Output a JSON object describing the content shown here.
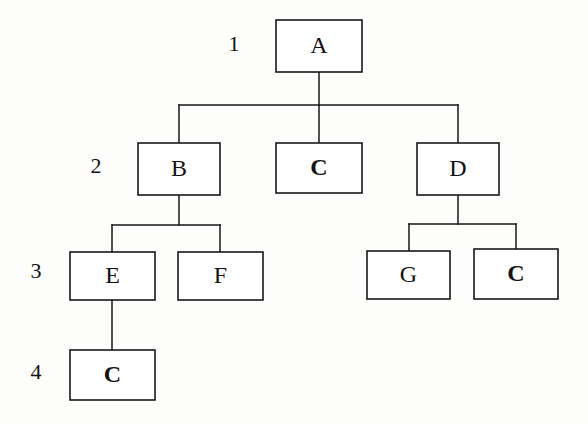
{
  "diagram": {
    "type": "tree",
    "background_color": "#fdfdfb",
    "line_color": "#16181a",
    "box_fill": "#ffffff",
    "text_color": "#121212",
    "canvas": {
      "width": 588,
      "height": 424
    },
    "level_labels": [
      {
        "id": "level-1",
        "text": "1",
        "x": 234,
        "y": 46,
        "font_size": 22
      },
      {
        "id": "level-2",
        "text": "2",
        "x": 96,
        "y": 168,
        "font_size": 22
      },
      {
        "id": "level-3",
        "text": "3",
        "x": 36,
        "y": 273,
        "font_size": 22
      },
      {
        "id": "level-4",
        "text": "4",
        "x": 36,
        "y": 374,
        "font_size": 22
      }
    ],
    "nodes": [
      {
        "id": "node-a",
        "label": "A",
        "weight": "normal",
        "level": 1,
        "x": 276,
        "y": 20,
        "w": 86,
        "h": 52,
        "font_size": 24
      },
      {
        "id": "node-b",
        "label": "B",
        "weight": "normal",
        "level": 2,
        "x": 138,
        "y": 143,
        "w": 82,
        "h": 52,
        "font_size": 24
      },
      {
        "id": "node-c2",
        "label": "C",
        "weight": "bold",
        "level": 2,
        "x": 276,
        "y": 143,
        "w": 86,
        "h": 50,
        "font_size": 24
      },
      {
        "id": "node-d",
        "label": "D",
        "weight": "normal",
        "level": 2,
        "x": 417,
        "y": 143,
        "w": 82,
        "h": 52,
        "font_size": 24
      },
      {
        "id": "node-e",
        "label": "E",
        "weight": "normal",
        "level": 3,
        "x": 70,
        "y": 252,
        "w": 85,
        "h": 48,
        "font_size": 24
      },
      {
        "id": "node-f",
        "label": "F",
        "weight": "normal",
        "level": 3,
        "x": 178,
        "y": 252,
        "w": 85,
        "h": 48,
        "font_size": 24
      },
      {
        "id": "node-g",
        "label": "G",
        "weight": "normal",
        "level": 3,
        "x": 367,
        "y": 251,
        "w": 83,
        "h": 48,
        "font_size": 24
      },
      {
        "id": "node-c3",
        "label": "C",
        "weight": "bold",
        "level": 3,
        "x": 474,
        "y": 249,
        "w": 84,
        "h": 50,
        "font_size": 24
      },
      {
        "id": "node-c4",
        "label": "C",
        "weight": "bold",
        "level": 4,
        "x": 70,
        "y": 350,
        "w": 85,
        "h": 50,
        "font_size": 24
      }
    ],
    "edges": [
      {
        "id": "edge-a-bus",
        "from": "node-a",
        "to": "bus-1",
        "points": "319,72 319,105"
      },
      {
        "id": "edge-bus1",
        "from": "bus-1",
        "to": "bus-1",
        "points": "179,105 458,105"
      },
      {
        "id": "edge-bus-b",
        "from": "bus-1",
        "to": "node-b",
        "points": "179,105 179,143"
      },
      {
        "id": "edge-bus-c2",
        "from": "bus-1",
        "to": "node-c2",
        "points": "319,105 319,143"
      },
      {
        "id": "edge-bus-d",
        "from": "bus-1",
        "to": "node-d",
        "points": "458,105 458,143"
      },
      {
        "id": "edge-b-bus",
        "from": "node-b",
        "to": "bus-2",
        "points": "179,195 179,225"
      },
      {
        "id": "edge-bus2",
        "from": "bus-2",
        "to": "bus-2",
        "points": "112,225 220,225"
      },
      {
        "id": "edge-bus-e",
        "from": "bus-2",
        "to": "node-e",
        "points": "112,225 112,252"
      },
      {
        "id": "edge-bus-f",
        "from": "bus-2",
        "to": "node-f",
        "points": "220,225 220,252"
      },
      {
        "id": "edge-d-bus",
        "from": "node-d",
        "to": "bus-3",
        "points": "458,195 458,224"
      },
      {
        "id": "edge-bus3",
        "from": "bus-3",
        "to": "bus-3",
        "points": "409,224 516,224"
      },
      {
        "id": "edge-bus-g",
        "from": "bus-3",
        "to": "node-g",
        "points": "409,224 409,251"
      },
      {
        "id": "edge-bus-c3",
        "from": "bus-3",
        "to": "node-c3",
        "points": "516,224 516,249"
      },
      {
        "id": "edge-e-c4",
        "from": "node-e",
        "to": "node-c4",
        "points": "112,300 112,350"
      }
    ],
    "tree_structure": {
      "root": "A",
      "children": [
        {
          "label": "B",
          "children": [
            {
              "label": "E",
              "children": [
                {
                  "label": "C",
                  "children": []
                }
              ]
            },
            {
              "label": "F",
              "children": []
            }
          ]
        },
        {
          "label": "C",
          "children": []
        },
        {
          "label": "D",
          "children": [
            {
              "label": "G",
              "children": []
            },
            {
              "label": "C",
              "children": []
            }
          ]
        }
      ]
    }
  }
}
